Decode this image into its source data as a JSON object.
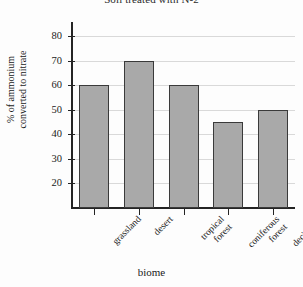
{
  "chart_data": {
    "type": "bar",
    "title": "Soil treated with N-2",
    "xlabel": "biome",
    "ylabel": "% of ammonium converted to nitrate",
    "ylabel_lines": [
      "% of ammonium",
      "converted to nitrate"
    ],
    "categories": [
      "grassland",
      "desert",
      "tropical forest",
      "coniferous forest",
      "deciduous forest"
    ],
    "category_lines": [
      [
        "grassland"
      ],
      [
        "desert"
      ],
      [
        "tropical",
        "forest"
      ],
      [
        "coniferous",
        "forest"
      ],
      [
        "deciduous",
        "forest"
      ]
    ],
    "values": [
      60,
      70,
      60,
      45,
      50
    ],
    "ylim": [
      10,
      84
    ],
    "yticks": [
      20,
      30,
      40,
      50,
      60,
      70,
      80
    ],
    "ytick_labels": [
      "20",
      "30",
      "40",
      "50",
      "60",
      "70",
      "80"
    ],
    "grid": true,
    "legend": false,
    "bar_color": "#a9a9a9",
    "bar_edge_color": "#3a3a3a",
    "axis_color": "#242424",
    "grid_color": "#d9d9d9",
    "background": "#fdfdfd"
  }
}
